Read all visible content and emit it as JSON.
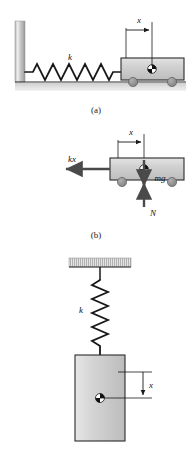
{
  "figure": {
    "background_color": "#ffffff",
    "panels": [
      {
        "id": "a",
        "caption": "(a)",
        "description": "Block on wheels attached by horizontal spring to a wall, resting on ground",
        "labels": {
          "spring_constant": "k",
          "displacement": "x"
        }
      },
      {
        "id": "b",
        "caption": "(b)",
        "description": "Free body diagram of the block showing spring force, weight and normal force",
        "labels": {
          "spring_force": "kx",
          "weight": "mg",
          "normal_force": "N",
          "displacement": "x"
        }
      },
      {
        "id": "c",
        "caption": "",
        "description": "Block hanging vertically from a spring attached to a ceiling",
        "labels": {
          "spring_constant": "k",
          "displacement": "x"
        }
      }
    ]
  },
  "colors": {
    "block_fill": "#cfcfcf",
    "block_edge": "#2b2b2b",
    "wheel_fill": "#8c8c8c",
    "wall_fill": "#c9c9c9",
    "ground_fill": "#c4c4c4",
    "line": "#1a1a1a",
    "com_dark": "#111111",
    "com_light": "#ffffff"
  }
}
